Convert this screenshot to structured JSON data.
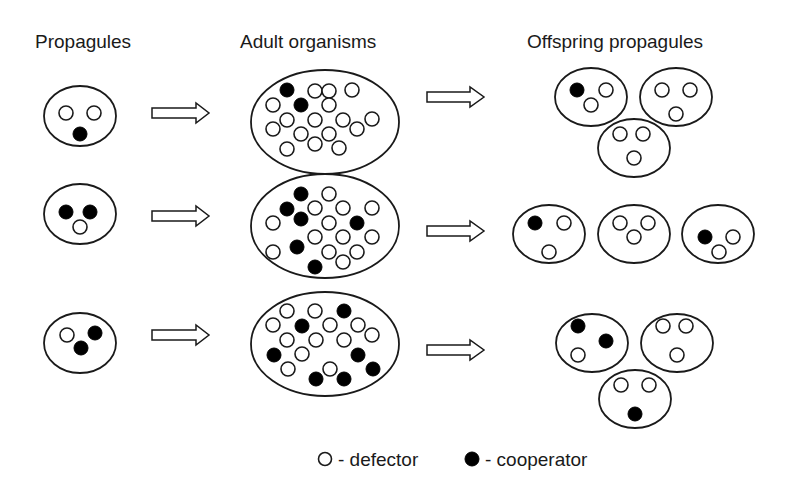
{
  "titles": {
    "propagules": "Propagules",
    "adults": "Adult organisms",
    "offspring": "Offspring propagules"
  },
  "legend": {
    "defector_label": "- defector",
    "cooperator_label": "- cooperator"
  },
  "colors": {
    "ink": "#1a1a1a",
    "cooperator_fill": "#000000",
    "defector_fill": "#ffffff",
    "background": "#ffffff"
  },
  "icons": {
    "defector": "open-circle",
    "cooperator": "filled-circle",
    "transition": "hollow-right-arrow"
  },
  "rows": [
    {
      "propagule": {
        "defectors": 2,
        "cooperators": 1
      },
      "adult": {
        "defectors": 21,
        "cooperators": 2
      },
      "offspring": [
        {
          "defectors": 2,
          "cooperators": 1
        },
        {
          "defectors": 3,
          "cooperators": 0
        },
        {
          "defectors": 3,
          "cooperators": 0
        }
      ]
    },
    {
      "propagule": {
        "defectors": 1,
        "cooperators": 2
      },
      "adult": {
        "defectors": 17,
        "cooperators": 6
      },
      "offspring": [
        {
          "defectors": 2,
          "cooperators": 1
        },
        {
          "defectors": 3,
          "cooperators": 0
        },
        {
          "defectors": 2,
          "cooperators": 1
        }
      ]
    },
    {
      "propagule": {
        "defectors": 1,
        "cooperators": 2
      },
      "adult": {
        "defectors": 14,
        "cooperators": 9
      },
      "offspring": [
        {
          "defectors": 1,
          "cooperators": 2
        },
        {
          "defectors": 3,
          "cooperators": 0
        },
        {
          "defectors": 2,
          "cooperators": 1
        }
      ]
    }
  ]
}
